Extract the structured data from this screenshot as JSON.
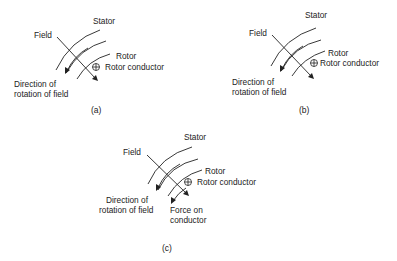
{
  "figure": {
    "panels": [
      {
        "id": "a",
        "caption": "(a)",
        "labels": {
          "stator": "Stator",
          "field": "Field",
          "rotor": "Rotor",
          "rotor_conductor": "Rotor conductor",
          "direction_line1": "Direction of",
          "direction_line2": "rotation of field"
        }
      },
      {
        "id": "b",
        "caption": "(b)",
        "labels": {
          "stator": "Stator",
          "field": "Field",
          "rotor": "Rotor",
          "rotor_conductor": "Rotor conductor",
          "direction_line1": "Direction of",
          "direction_line2": "rotation of field"
        }
      },
      {
        "id": "c",
        "caption": "(c)",
        "labels": {
          "stator": "Stator",
          "field": "Field",
          "rotor": "Rotor",
          "rotor_conductor": "Rotor conductor",
          "direction_line1": "Direction of",
          "direction_line2": "rotation of field",
          "force_line1": "Force on",
          "force_line2": "conductor"
        }
      }
    ],
    "symbols": {
      "conductor": "circle-plus (current into page)"
    }
  }
}
